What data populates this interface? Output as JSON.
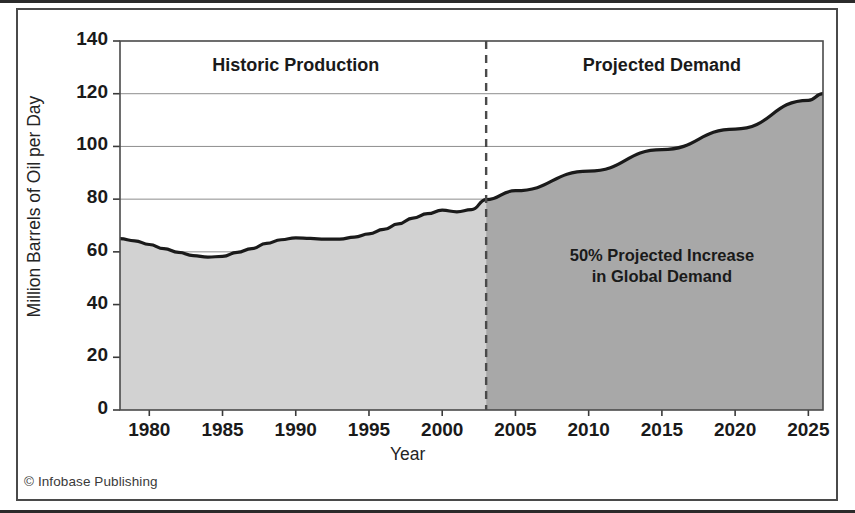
{
  "figure": {
    "credit": "© Infobase Publishing"
  },
  "chart_data": {
    "type": "area",
    "title": "",
    "xlabel": "Year",
    "ylabel": "Million Barrels of Oil per Day",
    "xlim": [
      1978,
      2026
    ],
    "ylim": [
      0,
      140
    ],
    "grid": true,
    "legend_position": "in-plot-annotations",
    "y_ticks": [
      0,
      20,
      40,
      60,
      80,
      100,
      120,
      140
    ],
    "y_tick_labels": [
      "0",
      "20",
      "40",
      "60",
      "80",
      "100",
      "120",
      "140"
    ],
    "x_ticks": [
      1980,
      1985,
      1990,
      1995,
      2000,
      2005,
      2010,
      2015,
      2020,
      2025
    ],
    "x_tick_labels": [
      "1980",
      "1985",
      "1990",
      "1995",
      "2000",
      "2005",
      "2010",
      "2015",
      "2020",
      "2025"
    ],
    "divider_x": 2003,
    "divider_style": "dashed",
    "annotations": [
      {
        "id": "historic",
        "text": "Historic Production",
        "x": 1990,
        "y": 130
      },
      {
        "id": "projected",
        "text": "Projected Demand",
        "x": 2015,
        "y": 130
      },
      {
        "id": "callout",
        "text": "50% Projected Increase\nin Global Demand",
        "x": 2015,
        "y": 58
      }
    ],
    "series": [
      {
        "name": "Historic Production",
        "fill_color": "#d2d2d2",
        "line_color": "#1a1a1a",
        "x": [
          1978,
          1979,
          1980,
          1981,
          1982,
          1983,
          1984,
          1985,
          1986,
          1987,
          1988,
          1989,
          1990,
          1991,
          1992,
          1993,
          1994,
          1995,
          1996,
          1997,
          1998,
          1999,
          2000,
          2001,
          2002,
          2003
        ],
        "values": [
          65.0,
          64.2,
          62.8,
          61.2,
          59.8,
          58.6,
          58.0,
          58.3,
          59.8,
          61.2,
          63.2,
          64.6,
          65.3,
          65.1,
          64.8,
          64.8,
          65.6,
          66.8,
          68.5,
          70.6,
          72.8,
          74.5,
          75.8,
          75.2,
          76.0,
          79.8
        ]
      },
      {
        "name": "Projected Demand",
        "fill_color": "#a8a8a8",
        "line_color": "#1a1a1a",
        "x": [
          2003,
          2005,
          2010,
          2015,
          2020,
          2025,
          2026
        ],
        "values": [
          79.8,
          83.2,
          90.6,
          98.8,
          106.6,
          117.5,
          120.0
        ]
      }
    ]
  }
}
